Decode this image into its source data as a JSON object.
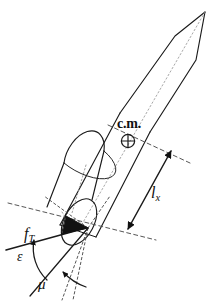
{
  "figure": {
    "background_color": "#ffffff",
    "line_color": "#1a1a1a",
    "stroke_width_px": 1.1
  },
  "labels": {
    "center_of_mass": "c.m.",
    "center_of_mass_symbol": "crossed-circle",
    "thrust_force": "f",
    "thrust_force_sub": "T",
    "moment_arm": "l",
    "moment_arm_sub": "x",
    "angle_epsilon": "ε",
    "angle_mu": "μ"
  },
  "annotations": [
    {
      "name": "c.m.",
      "meaning": "center of mass marker"
    },
    {
      "name": "f_T",
      "meaning": "thrust force vector"
    },
    {
      "name": "l_x",
      "meaning": "moment arm from nozzle to center of mass"
    },
    {
      "name": "epsilon",
      "meaning": "thrust deflection angle"
    },
    {
      "name": "mu",
      "meaning": "angle between body axis and reference line"
    }
  ],
  "geometry": {
    "nose_tip": [
      205,
      12
    ],
    "nose_shoulder_left": [
      175,
      36
    ],
    "nose_shoulder_right": [
      196,
      60
    ],
    "body_top_left": [
      120,
      113
    ],
    "body_bottom_left": [
      60,
      225
    ],
    "nozzle_center": [
      88,
      228
    ],
    "cm_point": [
      128,
      141
    ],
    "lx_arrow_start": [
      128,
      229
    ],
    "lx_arrow_end": [
      171,
      151
    ]
  }
}
